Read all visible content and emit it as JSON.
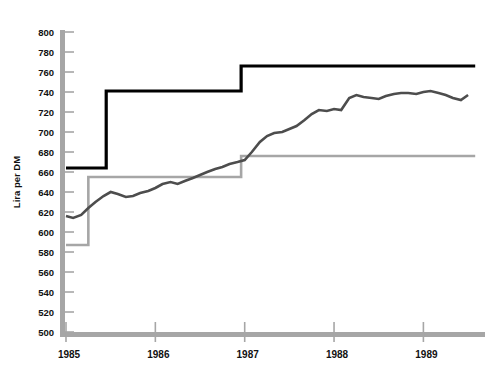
{
  "chart_data": {
    "type": "line",
    "title": "",
    "xlabel": "",
    "ylabel": "Lira per DM",
    "ylim": [
      500,
      800
    ],
    "ytick_step": 20,
    "yticks": [
      500,
      520,
      540,
      560,
      580,
      600,
      620,
      640,
      660,
      680,
      700,
      720,
      740,
      760,
      780,
      800
    ],
    "ytick_labels": [
      "500",
      "520",
      "540",
      "560",
      "580",
      "600",
      "620",
      "640",
      "660",
      "680",
      "700",
      "720",
      "740",
      "760",
      "780",
      "800"
    ],
    "xlim": [
      1985.0,
      1989.6
    ],
    "xticks": [
      1985,
      1986,
      1987,
      1988,
      1989
    ],
    "xtick_labels": [
      "1985",
      "1986",
      "1987",
      "1988",
      "1989"
    ],
    "grid": "x-ticks-only",
    "legend": "none",
    "colors": {
      "upper_band": "#000000",
      "central_rate_line": "#4d4d4d",
      "lower_band": "#a6a6a6",
      "axis": "#a6a6a6",
      "text": "#111111",
      "background": "#ffffff"
    },
    "series": [
      {
        "name": "Upper intervention limit",
        "style": "step",
        "color": "#000000",
        "width": 3.2,
        "x": [
          1985.0,
          1985.45,
          1985.45,
          1986.96,
          1986.96,
          1989.58
        ],
        "y": [
          664,
          664,
          741,
          741,
          766,
          766
        ]
      },
      {
        "name": "Lower intervention limit",
        "style": "step",
        "color": "#a6a6a6",
        "width": 2.6,
        "x": [
          1985.0,
          1985.25,
          1985.25,
          1986.96,
          1986.96,
          1989.58
        ],
        "y": [
          587,
          587,
          655,
          655,
          676,
          676
        ]
      },
      {
        "name": "Market exchange rate",
        "style": "line",
        "color": "#4d4d4d",
        "width": 2.6,
        "x": [
          1985.0,
          1985.08,
          1985.17,
          1985.25,
          1985.33,
          1985.42,
          1985.5,
          1985.58,
          1985.67,
          1985.75,
          1985.83,
          1985.92,
          1986.0,
          1986.08,
          1986.17,
          1986.25,
          1986.33,
          1986.42,
          1986.5,
          1986.58,
          1986.67,
          1986.75,
          1986.83,
          1986.92,
          1987.0,
          1987.08,
          1987.17,
          1987.25,
          1987.33,
          1987.42,
          1987.5,
          1987.58,
          1987.67,
          1987.75,
          1987.83,
          1987.92,
          1988.0,
          1988.08,
          1988.17,
          1988.25,
          1988.33,
          1988.42,
          1988.5,
          1988.58,
          1988.67,
          1988.75,
          1988.83,
          1988.92,
          1989.0,
          1989.08,
          1989.17,
          1989.25,
          1989.33,
          1989.42,
          1989.5
        ],
        "y": [
          616,
          614,
          617,
          624,
          630,
          636,
          640,
          638,
          635,
          636,
          639,
          641,
          644,
          648,
          650,
          648,
          651,
          654,
          657,
          660,
          663,
          665,
          668,
          670,
          672,
          680,
          690,
          696,
          699,
          700,
          703,
          706,
          712,
          718,
          722,
          721,
          723,
          722,
          734,
          737,
          735,
          734,
          733,
          736,
          738,
          739,
          739,
          738,
          740,
          741,
          739,
          737,
          734,
          732,
          737
        ]
      }
    ]
  },
  "axes": {
    "y_axis_title": "Lira per DM"
  }
}
